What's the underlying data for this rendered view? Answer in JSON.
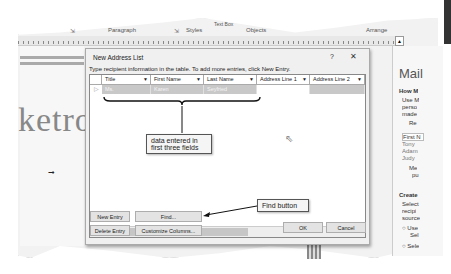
{
  "ribbon": {
    "groups": [
      "Paragraph",
      "Styles",
      "Objects",
      "Arrange"
    ],
    "text_box_label": "Text Box"
  },
  "ruler": {
    "marks": [
      "1",
      "2",
      "3",
      "4",
      "5",
      "6",
      "7"
    ],
    "toggle_button": "▲"
  },
  "document": {
    "visible_text": "ketro"
  },
  "mail_merge_pane": {
    "title": "Mail",
    "lines": [
      "How M",
      "Use M",
      "perso",
      "made",
      "Re",
      "First N",
      "Tony",
      "Adam",
      "Judy",
      "Me",
      "pu",
      "Create",
      "Select",
      "recipi",
      "source",
      "Use",
      "Sel",
      "Sele"
    ]
  },
  "dialog": {
    "title": "New Address List",
    "help_label": "?",
    "close_label": "✕",
    "instruction": "Type recipient information in the table.  To add more entries, click New Entry.",
    "columns": [
      "Title",
      "First Name",
      "Last Name",
      "Address Line 1",
      "Address Line 2"
    ],
    "rows": [
      {
        "Title": "Ms.",
        "First Name": "Karen",
        "Last Name": "Seyfried",
        "Address Line 1": "",
        "Address Line 2": ""
      }
    ],
    "scroll_left": "<",
    "scroll_right": ">",
    "buttons": {
      "new_entry": "New Entry",
      "find": "Find...",
      "delete_entry": "Delete Entry",
      "customize_columns": "Customize Columns...",
      "ok": "OK",
      "cancel": "Cancel"
    }
  },
  "callouts": {
    "data_entered": "data entered in first three fields",
    "find_button": "Find button"
  }
}
